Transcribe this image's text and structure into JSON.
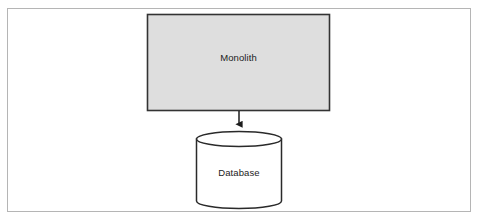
{
  "figure": {
    "background_color": "#ffffff",
    "frame": {
      "border_color": "#b5b5b5",
      "x": 7,
      "y": 8,
      "width": 464,
      "height": 204
    }
  },
  "nodes": {
    "monolith": {
      "label": "Monolith",
      "shape": "rectangle",
      "fill_color": "#dedede",
      "stroke_color": "#333333",
      "x": 147,
      "y": 14,
      "width": 183,
      "height": 97,
      "label_x": 238.5,
      "label_y": 58
    },
    "database": {
      "label": "Database",
      "shape": "cylinder",
      "fill_color": "#ffffff",
      "stroke_color": "#2a2a2a",
      "x": 196,
      "y": 132,
      "width": 86,
      "height": 76,
      "ellipse_ry": 7,
      "label_x": 239,
      "label_y": 173
    }
  },
  "edges": [
    {
      "name": "monolith-to-database",
      "from": "monolith",
      "to": "database",
      "style": "solid",
      "arrowhead": "filled-triangle",
      "stroke_color": "#1c1c1c",
      "x": 239,
      "y_start": 111,
      "y_end": 131
    }
  ]
}
